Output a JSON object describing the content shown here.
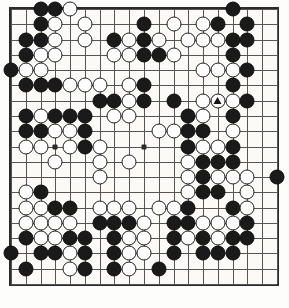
{
  "app": {
    "title": "Go Board Diagram",
    "caption": ""
  },
  "board": {
    "size": 19,
    "colors": {
      "board_background": "#fbfaf7",
      "grid_line": "#555555",
      "border": "#2b2b2b",
      "black_stone": "#1a1a1a",
      "white_stone": "#fefefe",
      "white_stone_outline": "#1e1e1e",
      "marker": "#141414"
    },
    "star_points": [
      [
        3,
        3
      ],
      [
        9,
        3
      ],
      [
        15,
        3
      ],
      [
        3,
        9
      ],
      [
        9,
        9
      ],
      [
        15,
        9
      ],
      [
        3,
        15
      ],
      [
        9,
        15
      ],
      [
        15,
        15
      ]
    ],
    "marker": {
      "type": "triangle",
      "col": 14,
      "row": 6,
      "on_color": "white"
    },
    "black_count": 116,
    "white_count": 109,
    "stones": [
      {
        "c": 2,
        "r": 0,
        "s": "b"
      },
      {
        "c": 3,
        "r": 0,
        "s": "b"
      },
      {
        "c": 4,
        "r": 0,
        "s": "w"
      },
      {
        "c": 15,
        "r": 0,
        "s": "b"
      },
      {
        "c": 2,
        "r": 1,
        "s": "b"
      },
      {
        "c": 3,
        "r": 1,
        "s": "w"
      },
      {
        "c": 5,
        "r": 1,
        "s": "w"
      },
      {
        "c": 9,
        "r": 1,
        "s": "b"
      },
      {
        "c": 11,
        "r": 1,
        "s": "w"
      },
      {
        "c": 13,
        "r": 1,
        "s": "w"
      },
      {
        "c": 14,
        "r": 1,
        "s": "b"
      },
      {
        "c": 16,
        "r": 1,
        "s": "b"
      },
      {
        "c": 1,
        "r": 2,
        "s": "b"
      },
      {
        "c": 2,
        "r": 2,
        "s": "b"
      },
      {
        "c": 3,
        "r": 2,
        "s": "w"
      },
      {
        "c": 5,
        "r": 2,
        "s": "w"
      },
      {
        "c": 7,
        "r": 2,
        "s": "b"
      },
      {
        "c": 8,
        "r": 2,
        "s": "w"
      },
      {
        "c": 9,
        "r": 2,
        "s": "b"
      },
      {
        "c": 10,
        "r": 2,
        "s": "w"
      },
      {
        "c": 12,
        "r": 2,
        "s": "w"
      },
      {
        "c": 13,
        "r": 2,
        "s": "w"
      },
      {
        "c": 14,
        "r": 2,
        "s": "w"
      },
      {
        "c": 15,
        "r": 2,
        "s": "b"
      },
      {
        "c": 16,
        "r": 2,
        "s": "b"
      },
      {
        "c": 1,
        "r": 3,
        "s": "b"
      },
      {
        "c": 2,
        "r": 3,
        "s": "w"
      },
      {
        "c": 3,
        "r": 3,
        "s": "w"
      },
      {
        "c": 7,
        "r": 3,
        "s": "w"
      },
      {
        "c": 8,
        "r": 3,
        "s": "w"
      },
      {
        "c": 9,
        "r": 3,
        "s": "b"
      },
      {
        "c": 10,
        "r": 3,
        "s": "b"
      },
      {
        "c": 11,
        "r": 3,
        "s": "w"
      },
      {
        "c": 15,
        "r": 3,
        "s": "b"
      },
      {
        "c": 0,
        "r": 4,
        "s": "b"
      },
      {
        "c": 1,
        "r": 4,
        "s": "w"
      },
      {
        "c": 2,
        "r": 4,
        "s": "w"
      },
      {
        "c": 13,
        "r": 4,
        "s": "w"
      },
      {
        "c": 14,
        "r": 4,
        "s": "w"
      },
      {
        "c": 15,
        "r": 4,
        "s": "w"
      },
      {
        "c": 16,
        "r": 4,
        "s": "b"
      },
      {
        "c": 1,
        "r": 5,
        "s": "b"
      },
      {
        "c": 2,
        "r": 5,
        "s": "b"
      },
      {
        "c": 3,
        "r": 5,
        "s": "b"
      },
      {
        "c": 4,
        "r": 5,
        "s": "w"
      },
      {
        "c": 5,
        "r": 5,
        "s": "w"
      },
      {
        "c": 6,
        "r": 5,
        "s": "w"
      },
      {
        "c": 8,
        "r": 5,
        "s": "w"
      },
      {
        "c": 9,
        "r": 5,
        "s": "b"
      },
      {
        "c": 15,
        "r": 5,
        "s": "b"
      },
      {
        "c": 6,
        "r": 6,
        "s": "b"
      },
      {
        "c": 7,
        "r": 6,
        "s": "b"
      },
      {
        "c": 8,
        "r": 6,
        "s": "w"
      },
      {
        "c": 9,
        "r": 6,
        "s": "b"
      },
      {
        "c": 11,
        "r": 6,
        "s": "b"
      },
      {
        "c": 13,
        "r": 6,
        "s": "w"
      },
      {
        "c": 14,
        "r": 6,
        "s": "w"
      },
      {
        "c": 15,
        "r": 6,
        "s": "w"
      },
      {
        "c": 16,
        "r": 6,
        "s": "b"
      },
      {
        "c": 1,
        "r": 7,
        "s": "b"
      },
      {
        "c": 2,
        "r": 7,
        "s": "w"
      },
      {
        "c": 3,
        "r": 7,
        "s": "b"
      },
      {
        "c": 4,
        "r": 7,
        "s": "b"
      },
      {
        "c": 5,
        "r": 7,
        "s": "b"
      },
      {
        "c": 7,
        "r": 7,
        "s": "w"
      },
      {
        "c": 8,
        "r": 7,
        "s": "w"
      },
      {
        "c": 12,
        "r": 7,
        "s": "b"
      },
      {
        "c": 13,
        "r": 7,
        "s": "w"
      },
      {
        "c": 15,
        "r": 7,
        "s": "b"
      },
      {
        "c": 1,
        "r": 8,
        "s": "b"
      },
      {
        "c": 2,
        "r": 8,
        "s": "b"
      },
      {
        "c": 3,
        "r": 8,
        "s": "w"
      },
      {
        "c": 4,
        "r": 8,
        "s": "w"
      },
      {
        "c": 5,
        "r": 8,
        "s": "b"
      },
      {
        "c": 10,
        "r": 8,
        "s": "w"
      },
      {
        "c": 11,
        "r": 8,
        "s": "w"
      },
      {
        "c": 12,
        "r": 8,
        "s": "b"
      },
      {
        "c": 13,
        "r": 8,
        "s": "b"
      },
      {
        "c": 15,
        "r": 8,
        "s": "w"
      },
      {
        "c": 1,
        "r": 9,
        "s": "w"
      },
      {
        "c": 2,
        "r": 9,
        "s": "w"
      },
      {
        "c": 4,
        "r": 9,
        "s": "w"
      },
      {
        "c": 5,
        "r": 9,
        "s": "b"
      },
      {
        "c": 6,
        "r": 9,
        "s": "w"
      },
      {
        "c": 12,
        "r": 9,
        "s": "b"
      },
      {
        "c": 13,
        "r": 9,
        "s": "w"
      },
      {
        "c": 14,
        "r": 9,
        "s": "w"
      },
      {
        "c": 15,
        "r": 9,
        "s": "b"
      },
      {
        "c": 3,
        "r": 10,
        "s": "w"
      },
      {
        "c": 6,
        "r": 10,
        "s": "w"
      },
      {
        "c": 8,
        "r": 10,
        "s": "w"
      },
      {
        "c": 12,
        "r": 10,
        "s": "w"
      },
      {
        "c": 13,
        "r": 10,
        "s": "b"
      },
      {
        "c": 14,
        "r": 10,
        "s": "b"
      },
      {
        "c": 15,
        "r": 10,
        "s": "b"
      },
      {
        "c": 6,
        "r": 11,
        "s": "w"
      },
      {
        "c": 12,
        "r": 11,
        "s": "w"
      },
      {
        "c": 13,
        "r": 11,
        "s": "b"
      },
      {
        "c": 14,
        "r": 11,
        "s": "w"
      },
      {
        "c": 15,
        "r": 11,
        "s": "w"
      },
      {
        "c": 16,
        "r": 11,
        "s": "w"
      },
      {
        "c": 18,
        "r": 11,
        "s": "b"
      },
      {
        "c": 1,
        "r": 12,
        "s": "w"
      },
      {
        "c": 2,
        "r": 12,
        "s": "b"
      },
      {
        "c": 12,
        "r": 12,
        "s": "w"
      },
      {
        "c": 13,
        "r": 12,
        "s": "b"
      },
      {
        "c": 14,
        "r": 12,
        "s": "b"
      },
      {
        "c": 16,
        "r": 12,
        "s": "w"
      },
      {
        "c": 1,
        "r": 13,
        "s": "w"
      },
      {
        "c": 2,
        "r": 13,
        "s": "w"
      },
      {
        "c": 3,
        "r": 13,
        "s": "b"
      },
      {
        "c": 4,
        "r": 13,
        "s": "b"
      },
      {
        "c": 6,
        "r": 13,
        "s": "w"
      },
      {
        "c": 7,
        "r": 13,
        "s": "w"
      },
      {
        "c": 8,
        "r": 13,
        "s": "w"
      },
      {
        "c": 10,
        "r": 13,
        "s": "w"
      },
      {
        "c": 11,
        "r": 13,
        "s": "w"
      },
      {
        "c": 12,
        "r": 13,
        "s": "b"
      },
      {
        "c": 15,
        "r": 13,
        "s": "b"
      },
      {
        "c": 16,
        "r": 13,
        "s": "w"
      },
      {
        "c": 1,
        "r": 14,
        "s": "w"
      },
      {
        "c": 2,
        "r": 14,
        "s": "w"
      },
      {
        "c": 3,
        "r": 14,
        "s": "w"
      },
      {
        "c": 4,
        "r": 14,
        "s": "w"
      },
      {
        "c": 6,
        "r": 14,
        "s": "b"
      },
      {
        "c": 7,
        "r": 14,
        "s": "b"
      },
      {
        "c": 8,
        "r": 14,
        "s": "b"
      },
      {
        "c": 9,
        "r": 14,
        "s": "w"
      },
      {
        "c": 11,
        "r": 14,
        "s": "b"
      },
      {
        "c": 12,
        "r": 14,
        "s": "b"
      },
      {
        "c": 13,
        "r": 14,
        "s": "w"
      },
      {
        "c": 14,
        "r": 14,
        "s": "w"
      },
      {
        "c": 15,
        "r": 14,
        "s": "w"
      },
      {
        "c": 16,
        "r": 14,
        "s": "b"
      },
      {
        "c": 1,
        "r": 15,
        "s": "b"
      },
      {
        "c": 2,
        "r": 15,
        "s": "w"
      },
      {
        "c": 3,
        "r": 15,
        "s": "w"
      },
      {
        "c": 4,
        "r": 15,
        "s": "b"
      },
      {
        "c": 5,
        "r": 15,
        "s": "b"
      },
      {
        "c": 7,
        "r": 15,
        "s": "b"
      },
      {
        "c": 8,
        "r": 15,
        "s": "w"
      },
      {
        "c": 9,
        "r": 15,
        "s": "w"
      },
      {
        "c": 11,
        "r": 15,
        "s": "b"
      },
      {
        "c": 12,
        "r": 15,
        "s": "w"
      },
      {
        "c": 13,
        "r": 15,
        "s": "b"
      },
      {
        "c": 14,
        "r": 15,
        "s": "w"
      },
      {
        "c": 15,
        "r": 15,
        "s": "b"
      },
      {
        "c": 16,
        "r": 15,
        "s": "b"
      },
      {
        "c": 0,
        "r": 16,
        "s": "b"
      },
      {
        "c": 2,
        "r": 16,
        "s": "b"
      },
      {
        "c": 3,
        "r": 16,
        "s": "b"
      },
      {
        "c": 4,
        "r": 16,
        "s": "w"
      },
      {
        "c": 5,
        "r": 16,
        "s": "b"
      },
      {
        "c": 7,
        "r": 16,
        "s": "b"
      },
      {
        "c": 8,
        "r": 16,
        "s": "w"
      },
      {
        "c": 9,
        "r": 16,
        "s": "w"
      },
      {
        "c": 11,
        "r": 16,
        "s": "b"
      },
      {
        "c": 13,
        "r": 16,
        "s": "b"
      },
      {
        "c": 14,
        "r": 16,
        "s": "b"
      },
      {
        "c": 15,
        "r": 16,
        "s": "b"
      },
      {
        "c": 1,
        "r": 17,
        "s": "b"
      },
      {
        "c": 4,
        "r": 17,
        "s": "w"
      },
      {
        "c": 5,
        "r": 17,
        "s": "b"
      },
      {
        "c": 7,
        "r": 17,
        "s": "b"
      },
      {
        "c": 8,
        "r": 17,
        "s": "w"
      },
      {
        "c": 10,
        "r": 17,
        "s": "b"
      }
    ]
  }
}
